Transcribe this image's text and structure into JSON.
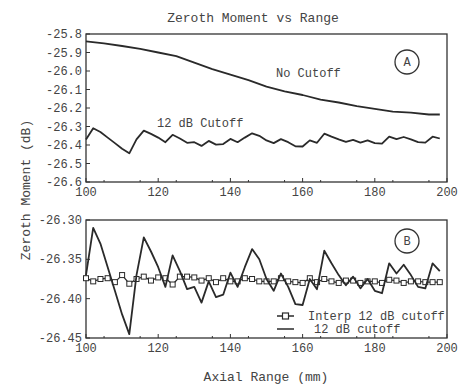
{
  "chart_data": [
    {
      "id": "A",
      "type": "line",
      "title": "Zeroth Moment vs Range",
      "xlabel": "",
      "ylabel": "Zeroth Moment (dB)",
      "xlim": [
        100,
        200
      ],
      "ylim": [
        -26.6,
        -25.8
      ],
      "xticks": [
        100,
        120,
        140,
        160,
        180,
        200
      ],
      "yticks": [
        -25.8,
        -25.9,
        -26.0,
        -26.1,
        -26.2,
        -26.3,
        -26.4,
        -26.5,
        -26.6
      ],
      "ytick_labels": [
        "-25.8",
        "-25.9",
        "-26.0",
        "-26.1",
        "-26.2",
        "-26.3",
        "-26.4",
        "-26.5",
        "-26.6"
      ],
      "panel_label": "A",
      "grid": false,
      "series": [
        {
          "name": "No Cutoff",
          "x": [
            100,
            105,
            110,
            115,
            120,
            125,
            130,
            135,
            140,
            145,
            150,
            155,
            160,
            165,
            170,
            175,
            180,
            185,
            190,
            195,
            198
          ],
          "values": [
            -25.84,
            -25.85,
            -25.865,
            -25.88,
            -25.9,
            -25.92,
            -25.955,
            -25.99,
            -26.02,
            -26.05,
            -26.085,
            -26.11,
            -26.13,
            -26.155,
            -26.17,
            -26.19,
            -26.205,
            -26.22,
            -26.225,
            -26.235,
            -26.235
          ]
        },
        {
          "name": "12 dB Cutoff",
          "x": [
            100,
            102,
            104,
            106,
            108,
            110,
            112,
            114,
            116,
            118,
            120,
            122,
            124,
            126,
            128,
            130,
            132,
            134,
            136,
            138,
            140,
            142,
            144,
            146,
            148,
            150,
            152,
            154,
            156,
            158,
            160,
            162,
            164,
            166,
            168,
            170,
            172,
            174,
            176,
            178,
            180,
            182,
            184,
            186,
            188,
            190,
            192,
            194,
            196,
            198
          ],
          "values": [
            -26.37,
            -26.31,
            -26.33,
            -26.36,
            -26.39,
            -26.42,
            -26.445,
            -26.37,
            -26.322,
            -26.34,
            -26.36,
            -26.385,
            -26.345,
            -26.365,
            -26.388,
            -26.385,
            -26.405,
            -26.378,
            -26.398,
            -26.395,
            -26.367,
            -26.385,
            -26.36,
            -26.337,
            -26.35,
            -26.375,
            -26.39,
            -26.368,
            -26.385,
            -26.407,
            -26.408,
            -26.375,
            -26.388,
            -26.339,
            -26.355,
            -26.37,
            -26.383,
            -26.372,
            -26.387,
            -26.375,
            -26.39,
            -26.393,
            -26.355,
            -26.368,
            -26.357,
            -26.37,
            -26.385,
            -26.387,
            -26.355,
            -26.365
          ]
        }
      ],
      "annotations": [
        {
          "text": "No Cutoff",
          "x": 160,
          "y": -26.02
        },
        {
          "text": "12 dB Cutoff",
          "x": 128,
          "y": -26.26
        }
      ]
    },
    {
      "id": "B",
      "type": "line",
      "title": "",
      "xlabel": "Axial Range (mm)",
      "ylabel": "Zeroth Moment (dB)",
      "xlim": [
        100,
        200
      ],
      "ylim": [
        -26.45,
        -26.3
      ],
      "xticks": [
        100,
        120,
        140,
        160,
        180,
        200
      ],
      "yticks": [
        -26.3,
        -26.35,
        -26.4,
        -26.45
      ],
      "ytick_labels": [
        "-26.30",
        "-26.35",
        "-26.40",
        "-26.45"
      ],
      "panel_label": "B",
      "grid": false,
      "legend_position": "lower right",
      "series": [
        {
          "name": "Interp 12 dB cutoff",
          "marker": "square",
          "x": [
            100,
            102,
            104,
            106,
            108,
            110,
            112,
            114,
            116,
            118,
            120,
            122,
            124,
            126,
            128,
            130,
            132,
            134,
            136,
            138,
            140,
            142,
            144,
            146,
            148,
            150,
            152,
            154,
            156,
            158,
            160,
            162,
            164,
            166,
            168,
            170,
            172,
            174,
            176,
            178,
            180,
            182,
            184,
            186,
            188,
            190,
            192,
            194,
            196,
            198
          ],
          "values": [
            -26.374,
            -26.378,
            -26.375,
            -26.374,
            -26.379,
            -26.37,
            -26.381,
            -26.375,
            -26.372,
            -26.377,
            -26.373,
            -26.374,
            -26.382,
            -26.372,
            -26.372,
            -26.373,
            -26.377,
            -26.374,
            -26.379,
            -26.374,
            -26.378,
            -26.378,
            -26.374,
            -26.375,
            -26.378,
            -26.378,
            -26.378,
            -26.374,
            -26.378,
            -26.379,
            -26.38,
            -26.374,
            -26.379,
            -26.375,
            -26.378,
            -26.38,
            -26.377,
            -26.377,
            -26.38,
            -26.378,
            -26.378,
            -26.38,
            -26.376,
            -26.377,
            -26.38,
            -26.378,
            -26.378,
            -26.379,
            -26.379,
            -26.379
          ]
        },
        {
          "name": "12 dB cutoff",
          "marker": "none",
          "x": [
            100,
            102,
            104,
            106,
            108,
            110,
            112,
            114,
            116,
            118,
            120,
            122,
            124,
            126,
            128,
            130,
            132,
            134,
            136,
            138,
            140,
            142,
            144,
            146,
            148,
            150,
            152,
            154,
            156,
            158,
            160,
            162,
            164,
            166,
            168,
            170,
            172,
            174,
            176,
            178,
            180,
            182,
            184,
            186,
            188,
            190,
            192,
            194,
            196,
            198
          ],
          "values": [
            -26.37,
            -26.31,
            -26.33,
            -26.36,
            -26.39,
            -26.42,
            -26.445,
            -26.37,
            -26.322,
            -26.34,
            -26.36,
            -26.385,
            -26.345,
            -26.365,
            -26.388,
            -26.385,
            -26.405,
            -26.378,
            -26.398,
            -26.395,
            -26.367,
            -26.385,
            -26.36,
            -26.337,
            -26.35,
            -26.375,
            -26.39,
            -26.368,
            -26.385,
            -26.407,
            -26.408,
            -26.375,
            -26.388,
            -26.339,
            -26.355,
            -26.37,
            -26.383,
            -26.372,
            -26.387,
            -26.375,
            -26.39,
            -26.393,
            -26.355,
            -26.368,
            -26.357,
            -26.37,
            -26.385,
            -26.387,
            -26.355,
            -26.365
          ]
        }
      ]
    }
  ],
  "labels": {
    "title": "Zeroth Moment vs Range",
    "ylabel": "Zeroth Moment (dB)",
    "xlabel": "Axial Range (mm)",
    "panel_a": "A",
    "panel_b": "B",
    "no_cutoff": "No Cutoff",
    "cutoff_12db": "12 dB Cutoff",
    "legend_interp": "Interp 12 dB cutoff",
    "legend_raw": "12 dB cutoff"
  },
  "colors": {
    "line": "#2a2a2a",
    "axis": "#333333",
    "text": "#444444",
    "background": "#ffffff"
  }
}
